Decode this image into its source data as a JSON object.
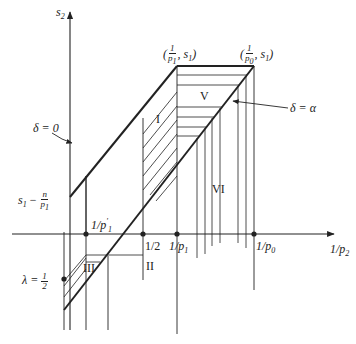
{
  "axes": {
    "y_label": "s",
    "y_label_sub": "2",
    "x_label": "1/p",
    "x_label_sub": "2"
  },
  "corner_labels": {
    "top_left": {
      "open": "(",
      "num": "1",
      "den": "p",
      "den_sub": "1",
      "rest": ", s",
      "rest_sub": "1",
      "close": ")"
    },
    "top_right": {
      "open": "(",
      "num": "1",
      "den": "p",
      "den_sub": "0",
      "rest": ", s",
      "rest_sub": "1",
      "close": ")"
    }
  },
  "line_labels": {
    "delta_zero": "δ = 0",
    "delta_alpha": "δ = α"
  },
  "tick_labels": {
    "p1_prime": {
      "text": "1/p",
      "sub": "1",
      "sup": "'"
    },
    "half": "1/2",
    "p1": {
      "text": "1/p",
      "sub": "1"
    },
    "p0": {
      "text": "1/p",
      "sub": "0"
    }
  },
  "y_markers": {
    "s1_minus": {
      "text": "s",
      "sub": "1",
      "minus": " − ",
      "num": "n",
      "den": "p",
      "den_sub": "1"
    },
    "lambda": {
      "text": "λ = ",
      "num": "1",
      "den": "2"
    }
  },
  "regions": {
    "I": "I",
    "II": "II",
    "III": "III",
    "V": "V",
    "VI": "VI"
  },
  "colors": {
    "line": "#222222",
    "background": "#ffffff"
  }
}
